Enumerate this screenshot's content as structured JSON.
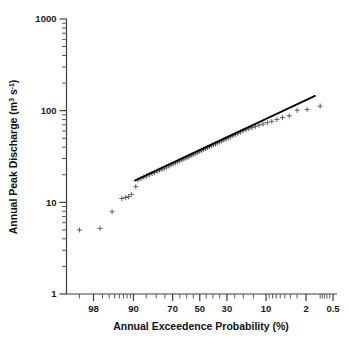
{
  "chart_data": {
    "type": "scatter",
    "title": "",
    "subtitle": "",
    "xlabel": "Annual Exceedence Probability (%)",
    "ylabel": "Annual Peak Discharge (m",
    "ylabel_sup": "3",
    "ylabel_mid": " s",
    "ylabel_sup2": "-1",
    "ylabel_end": ")",
    "ylabel_full": "Annual Peak Discharge (m3 s-1)",
    "x_scale": "probability",
    "y_scale": "log",
    "xlim": [
      99.5,
      0.4
    ],
    "ylim": [
      1,
      1000
    ],
    "grid": false,
    "legend": null,
    "x_tick_labels": [
      "98",
      "90",
      "70",
      "50",
      "30",
      "10",
      "2",
      "0.5"
    ],
    "x_tick_values": [
      98,
      90,
      70,
      50,
      30,
      10,
      2,
      0.5
    ],
    "y_tick_labels": [
      "1",
      "10",
      "100",
      "1000"
    ],
    "y_tick_values": [
      1,
      10,
      100,
      1000
    ],
    "x_minor_ticks": [
      99,
      97,
      96,
      95,
      94,
      93,
      92,
      91,
      85,
      80,
      75,
      65,
      60,
      55,
      45,
      40,
      35,
      25,
      20,
      15,
      9,
      8,
      7,
      6,
      5,
      4,
      3,
      1,
      0.9,
      0.8,
      0.7,
      0.6
    ],
    "series": [
      {
        "name": "Annual peak discharge",
        "marker": "plus",
        "color": "#4a4a4a",
        "points": [
          [
            99.0,
            5.0
          ],
          [
            97.3,
            5.2
          ],
          [
            95.5,
            7.9
          ],
          [
            93.4,
            11.0
          ],
          [
            92.4,
            11.3
          ],
          [
            91.6,
            11.5
          ],
          [
            90.7,
            12.2
          ],
          [
            89.2,
            14.8
          ],
          [
            88.4,
            17.5
          ],
          [
            87.2,
            18.2
          ],
          [
            86.0,
            18.8
          ],
          [
            84.8,
            19.4
          ],
          [
            83.5,
            20.0
          ],
          [
            82.2,
            20.6
          ],
          [
            80.9,
            21.2
          ],
          [
            79.5,
            21.8
          ],
          [
            78.1,
            22.4
          ],
          [
            76.7,
            23.0
          ],
          [
            75.3,
            23.6
          ],
          [
            73.9,
            24.3
          ],
          [
            72.5,
            25.0
          ],
          [
            71.0,
            25.7
          ],
          [
            69.6,
            26.4
          ],
          [
            68.1,
            27.0
          ],
          [
            66.6,
            27.7
          ],
          [
            65.1,
            28.4
          ],
          [
            63.6,
            29.1
          ],
          [
            62.1,
            29.8
          ],
          [
            60.6,
            30.5
          ],
          [
            59.1,
            31.2
          ],
          [
            57.6,
            32.0
          ],
          [
            56.1,
            32.8
          ],
          [
            54.6,
            33.6
          ],
          [
            53.1,
            34.4
          ],
          [
            51.6,
            35.2
          ],
          [
            50.1,
            36.0
          ],
          [
            48.6,
            36.9
          ],
          [
            47.1,
            37.8
          ],
          [
            45.6,
            38.7
          ],
          [
            44.1,
            39.6
          ],
          [
            42.6,
            40.5
          ],
          [
            41.1,
            41.5
          ],
          [
            39.6,
            42.5
          ],
          [
            38.1,
            43.5
          ],
          [
            36.6,
            44.5
          ],
          [
            35.1,
            45.6
          ],
          [
            33.6,
            46.7
          ],
          [
            32.1,
            47.9
          ],
          [
            30.6,
            49.2
          ],
          [
            29.1,
            50.5
          ],
          [
            27.6,
            51.9
          ],
          [
            26.1,
            53.4
          ],
          [
            24.6,
            55.0
          ],
          [
            23.1,
            56.7
          ],
          [
            21.6,
            58.5
          ],
          [
            20.1,
            60.4
          ],
          [
            18.6,
            62.0
          ],
          [
            17.1,
            63.5
          ],
          [
            15.6,
            65.5
          ],
          [
            14.1,
            67.5
          ],
          [
            12.6,
            69.5
          ],
          [
            11.1,
            71.5
          ],
          [
            9.6,
            74.0
          ],
          [
            8.2,
            76.5
          ],
          [
            6.8,
            80.0
          ],
          [
            5.5,
            84.0
          ],
          [
            4.2,
            88.0
          ],
          [
            3.0,
            101.0
          ],
          [
            1.9,
            103.0
          ],
          [
            1.0,
            112.0
          ]
        ]
      }
    ],
    "fit_line": {
      "name": "Log-Pearson fit",
      "color": "#000000",
      "x_start": 89.5,
      "y_start": 17.3,
      "x_end": 1.3,
      "y_end": 145.0
    }
  }
}
